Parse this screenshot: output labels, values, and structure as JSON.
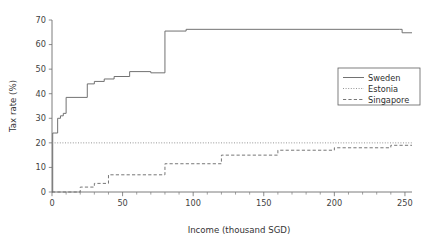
{
  "chart_data": {
    "type": "line",
    "title": "",
    "xlabel": "Income (thousand SGD)",
    "ylabel": "Tax rate (%)",
    "xlim": [
      0,
      255
    ],
    "ylim": [
      0,
      70
    ],
    "xticks": [
      0,
      50,
      100,
      150,
      200,
      250
    ],
    "yticks": [
      0,
      10,
      20,
      30,
      40,
      50,
      60,
      70
    ],
    "xtick_labels": [
      "0",
      "50",
      "100",
      "150",
      "200",
      "250"
    ],
    "ytick_labels": [
      "0",
      "10",
      "20",
      "30",
      "40",
      "50",
      "60",
      "70"
    ],
    "xminor_step": 10,
    "grid": false,
    "legend_position": "upper right",
    "series": [
      {
        "name": "Sweden",
        "style": "solid",
        "color": "#6a6a6a",
        "step": "post",
        "x": [
          0,
          0.5,
          2,
          4,
          6,
          8,
          10,
          25,
          30,
          37,
          44,
          55,
          70,
          80,
          95,
          246,
          248,
          255
        ],
        "y": [
          0,
          24,
          24,
          30,
          31,
          32,
          38.5,
          44,
          45,
          46,
          47,
          49,
          48.5,
          65.5,
          66.2,
          66.2,
          64.8,
          64.8
        ]
      },
      {
        "name": "Estonia",
        "style": "dotted",
        "color": "#8a8a8a",
        "step": "post",
        "x": [
          0,
          255
        ],
        "y": [
          20,
          20
        ]
      },
      {
        "name": "Singapore",
        "style": "dashed",
        "color": "#707070",
        "step": "post",
        "x": [
          0,
          20,
          30,
          40,
          80,
          120,
          160,
          200,
          240,
          255
        ],
        "y": [
          0,
          2,
          3.5,
          7,
          11.5,
          15,
          17,
          18,
          19,
          19
        ]
      }
    ]
  },
  "legend": {
    "entries": [
      {
        "label": "Sweden",
        "style": "solid"
      },
      {
        "label": "Estonia",
        "style": "dotted"
      },
      {
        "label": "Singapore",
        "style": "dashed"
      }
    ]
  }
}
